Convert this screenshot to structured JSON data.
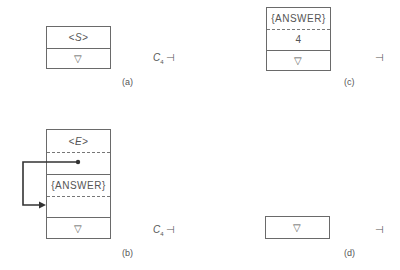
{
  "panels": {
    "a": {
      "label": "(a)",
      "cells": [
        "<S>",
        "▽"
      ],
      "state": {
        "symbol": "C",
        "sub": "4",
        "end": "⊣"
      }
    },
    "b": {
      "label": "(b)",
      "cells": [
        "<E>",
        "",
        "{ANSWER}",
        "",
        "▽"
      ],
      "state": {
        "symbol": "C",
        "sub": "4",
        "end": "⊣"
      },
      "pointer": {
        "from": "row-2",
        "to": "row-4"
      }
    },
    "c": {
      "label": "(c)",
      "cells": [
        "{ANSWER}",
        "4",
        "▽"
      ],
      "state": {
        "end": "⊣"
      }
    },
    "d": {
      "label": "(d)",
      "cells": [
        "▽"
      ],
      "state": {
        "end": "⊣"
      }
    }
  }
}
